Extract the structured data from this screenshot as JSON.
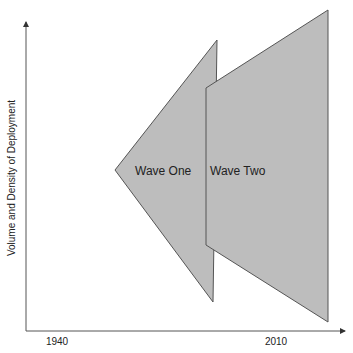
{
  "diagram": {
    "y_axis_label": "Volume and Density of Deployment",
    "x_ticks": [
      {
        "label": "1940",
        "x": 57
      },
      {
        "label": "2010",
        "x": 276
      }
    ],
    "shapes": [
      {
        "name": "wave-one",
        "label": "Wave One",
        "points": "115,170 217,40 213,302",
        "fill": "#bdbdbd",
        "stroke": "#555555"
      },
      {
        "name": "wave-two",
        "label": "Wave Two",
        "points": "206,88 328,10 328,322 206,245",
        "fill": "#bdbdbd",
        "stroke": "#555555"
      }
    ],
    "colors": {
      "axis": "#555555",
      "shape_fill": "#bdbdbd",
      "text": "#222222"
    }
  }
}
